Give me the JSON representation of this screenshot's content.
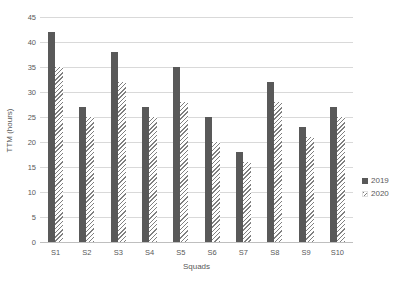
{
  "chart_data": {
    "type": "bar",
    "title": "",
    "categories": [
      "S1",
      "S2",
      "S3",
      "S4",
      "S5",
      "S6",
      "S7",
      "S8",
      "S9",
      "S10"
    ],
    "series": [
      {
        "name": "2019",
        "style": "solid",
        "color": "#595959",
        "values": [
          42,
          27,
          38,
          27,
          35,
          25,
          18,
          32,
          23,
          27
        ]
      },
      {
        "name": "2020",
        "style": "hatched",
        "color": "#808080",
        "values": [
          35,
          25,
          32,
          25,
          28,
          20,
          16,
          28,
          21,
          25
        ]
      }
    ],
    "xlabel": "Squads",
    "ylabel": "TTM (hours)",
    "ylim": [
      0,
      45
    ],
    "ytick_step": 5,
    "ytick_labels": [
      "0",
      "5",
      "10",
      "15",
      "20",
      "25",
      "30",
      "35",
      "40",
      "45"
    ],
    "grid": true,
    "legend_position": "right",
    "legend_entries": [
      "2019",
      "2020"
    ]
  },
  "colors": {
    "bar_2019": "#595959",
    "bar_2020_hatch": "#808080",
    "gridline": "#d9d9d9",
    "axis_line": "#bfbfbf",
    "text": "#595959",
    "background": "#ffffff"
  }
}
